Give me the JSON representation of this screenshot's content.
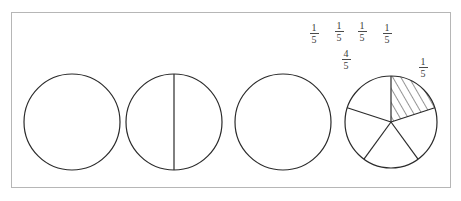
{
  "figure": {
    "background_color": "#ffffff",
    "frame": {
      "border_color": "#b6b6b6",
      "x": 11,
      "y": 12,
      "width": 440,
      "height": 176
    },
    "stroke_color": "#2b2b2b",
    "text_color": "#3a3a3a"
  },
  "labels": [
    {
      "id": "label-1",
      "numerator": "1",
      "denominator": "5",
      "x": 303,
      "y": 23
    },
    {
      "id": "label-2",
      "numerator": "1",
      "denominator": "5",
      "x": 328,
      "y": 21
    },
    {
      "id": "label-3",
      "numerator": "1",
      "denominator": "5",
      "x": 351,
      "y": 21
    },
    {
      "id": "label-4",
      "numerator": "1",
      "denominator": "5",
      "x": 376,
      "y": 23
    },
    {
      "id": "label-5",
      "numerator": "4",
      "denominator": "5",
      "x": 335,
      "y": 49
    },
    {
      "id": "label-6",
      "numerator": "1",
      "denominator": "5",
      "x": 412,
      "y": 57
    }
  ],
  "circles": [
    {
      "id": "circle-plain",
      "name": "circle-1-undivided",
      "cx": 72,
      "cy": 122,
      "r": 48,
      "divisions": 0,
      "shaded_sectors": []
    },
    {
      "id": "circle-halves",
      "name": "circle-2-vertical-diameter",
      "cx": 174,
      "cy": 122,
      "r": 48,
      "divisions": 2,
      "shaded_sectors": []
    },
    {
      "id": "circle-plain-2",
      "name": "circle-3-undivided",
      "cx": 283,
      "cy": 122,
      "r": 48,
      "divisions": 0,
      "shaded_sectors": []
    },
    {
      "id": "circle-fifths",
      "name": "circle-4-fifths-one-shaded",
      "cx": 391,
      "cy": 122,
      "r": 46,
      "divisions": 5,
      "shaded_sectors": [
        0
      ]
    }
  ],
  "chart_data": {
    "type": "pie",
    "categories": [
      "fifth 1",
      "fifth 2",
      "fifth 3",
      "fifth 4",
      "fifth 5"
    ],
    "values": [
      0.2,
      0.2,
      0.2,
      0.2,
      0.2
    ],
    "value_labels": [
      "1/5",
      "1/5",
      "1/5",
      "1/5",
      "1/5"
    ],
    "annotations": [
      "1/5",
      "1/5",
      "1/5",
      "1/5",
      "4/5",
      "1/5"
    ],
    "shaded_fraction": "1/5",
    "unshaded_fraction": "4/5",
    "legend": "none",
    "grid": false
  }
}
